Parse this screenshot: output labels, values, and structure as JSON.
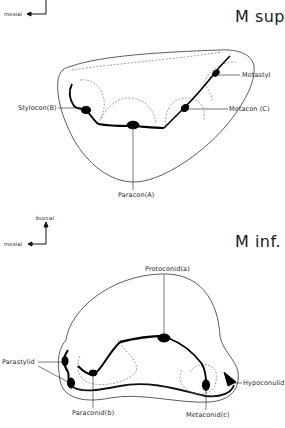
{
  "upper": {
    "title": "M sup.",
    "orientation": {
      "horizontal": "mesial"
    },
    "labels": {
      "stylocon": "Stylocon(B)",
      "metastyl": "Metastyl",
      "metacon": "Metacon (C)",
      "paracon": "Paracon(A)"
    }
  },
  "lower": {
    "title": "M inf.",
    "orientation": {
      "vertical": "buccal",
      "horizontal": "mesial"
    },
    "labels": {
      "protoconid": "Protoconid(a)",
      "parastylid": "Parastylid",
      "paraconid": "Paraconid(b)",
      "metaconid": "Metaconid(c)",
      "hypoconulid": "Hypoconulid"
    }
  }
}
